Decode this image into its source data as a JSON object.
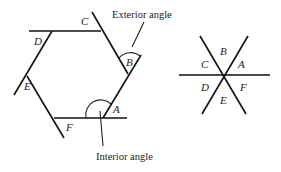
{
  "hexagon_diagram": {
    "vertex_labels": {
      "A": "A",
      "B": "B",
      "C": "C",
      "D": "D",
      "E": "E",
      "F": "F"
    },
    "annotations": {
      "exterior": "Exterior angle",
      "interior": "Interior angle"
    }
  },
  "intersection_diagram": {
    "angle_labels": {
      "A": "A",
      "B": "B",
      "C": "C",
      "D": "D",
      "E": "E",
      "F": "F"
    }
  },
  "colors": {
    "line": "#111111",
    "text": "#222222",
    "background": "#ffffff"
  }
}
